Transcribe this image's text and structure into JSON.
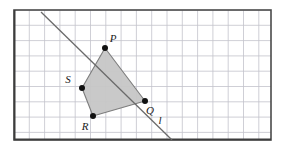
{
  "figure": {
    "type": "geometry-diagram",
    "canvas": {
      "width": 286,
      "height": 147,
      "background": "#ffffff"
    },
    "frame": {
      "x": 14,
      "y": 10,
      "width": 257,
      "height": 130,
      "stroke": "#4a4a4a",
      "stroke_width": 1.6,
      "fill": "#ffffff"
    },
    "grid": {
      "cell_size": 15.3,
      "origin_x": 14,
      "origin_y": 10,
      "columns": 17,
      "rows": 8,
      "stroke": "#c3c3cb",
      "stroke_width": 0.8,
      "visible": true
    },
    "polygon": {
      "name": "PQRS",
      "fill": "#c6c6c6",
      "fill_opacity": 0.95,
      "stroke": "#7d7d7d",
      "stroke_width": 1.1,
      "points": "105,48 145,101 93,116 82,88"
    },
    "vertices": [
      {
        "id": "P",
        "label": "P",
        "cx": 105,
        "cy": 48,
        "r": 3.0,
        "fill": "#111111",
        "label_x": 113,
        "label_y": 42
      },
      {
        "id": "Q",
        "label": "Q",
        "cx": 145,
        "cy": 101,
        "r": 3.0,
        "fill": "#111111",
        "label_x": 150,
        "label_y": 114
      },
      {
        "id": "R",
        "label": "R",
        "cx": 93,
        "cy": 116,
        "r": 3.0,
        "fill": "#111111",
        "label_x": 85,
        "label_y": 130
      },
      {
        "id": "S",
        "label": "S",
        "cx": 82,
        "cy": 88,
        "r": 3.0,
        "fill": "#111111",
        "label_x": 68,
        "label_y": 83
      }
    ],
    "line": {
      "id": "l",
      "label": "l",
      "x1": 41,
      "y1": 12,
      "x2": 172,
      "y2": 140,
      "stroke": "#6a6a6a",
      "stroke_width": 1.3,
      "label_x": 160,
      "label_y": 124
    },
    "colors": {
      "frame_stroke": "#4a4a4a",
      "grid_stroke": "#c3c3cb",
      "polygon_fill": "#c6c6c6",
      "polygon_stroke": "#7d7d7d",
      "line_stroke": "#6a6a6a",
      "vertex_fill": "#111111",
      "label_text": "#1a1a1a",
      "background": "#ffffff"
    }
  }
}
